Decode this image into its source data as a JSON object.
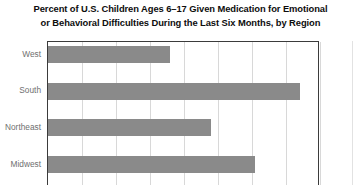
{
  "title": {
    "line1": "Percent of U.S. Children Ages 6–17 Given Medication for Emotional",
    "line2": "or Behavioral Difficulties During the Last Six Months, by Region"
  },
  "colors": {
    "bar": "#8a8a8a",
    "axis": "#3b3b3b",
    "gridline": "#d8d8d8",
    "label": "#6f6f6f",
    "title": "#0d0d0d",
    "background": "#ffffff"
  },
  "chart_data": {
    "type": "bar",
    "orientation": "horizontal",
    "title": "Percent of U.S. Children Ages 6–17 Given Medication for Emotional or Behavioral Difficulties During the Last Six Months, by Region",
    "xlabel": "",
    "ylabel": "",
    "categories": [
      "West",
      "South",
      "Northeast",
      "Midwest"
    ],
    "values": [
      3.6,
      7.4,
      4.8,
      6.1
    ],
    "xlim": [
      0,
      8
    ],
    "ylim": [
      0,
      4
    ],
    "xticks": [
      0,
      1,
      2,
      3,
      4,
      5,
      6,
      7,
      8
    ],
    "xticklabels": [
      "",
      "",
      "",
      "",
      "",
      "",
      "",
      "",
      ""
    ],
    "grid": true,
    "grid_axis": "x",
    "legend": false,
    "legend_position": "none",
    "note": "Bottom of figure is cropped; x-axis tick labels are not visible in this view."
  }
}
